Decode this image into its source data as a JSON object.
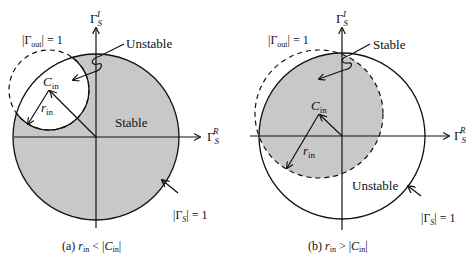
{
  "colors": {
    "shade": "#c8c8c8",
    "line": "#111111",
    "bg": "#ffffff"
  },
  "panel_a": {
    "axis_imag": "Γ",
    "axis_imag_sub": "S",
    "axis_imag_sup": "I",
    "axis_real": "Γ",
    "axis_real_sub": "S",
    "axis_real_sup": "R",
    "gamma_out_label_pre": "|Γ",
    "gamma_out_label_sub": "out",
    "gamma_out_label_post": "| = 1",
    "region_unstable": "Unstable",
    "region_stable": "Stable",
    "center_label": "C",
    "center_label_sub": "in",
    "radius_label": "r",
    "radius_label_sub": "in",
    "unit_circle_label_pre": "|Γ",
    "unit_circle_label_sub": "S",
    "unit_circle_label_post": "| = 1",
    "caption_pre": "(a) ",
    "caption_r": "r",
    "caption_r_sub": "in",
    "caption_mid": " < |",
    "caption_c": "C",
    "caption_c_sub": "in",
    "caption_post": "|"
  },
  "panel_b": {
    "axis_imag": "Γ",
    "axis_imag_sub": "S",
    "axis_imag_sup": "I",
    "axis_real": "Γ",
    "axis_real_sub": "S",
    "axis_real_sup": "R",
    "gamma_out_label_pre": "|Γ",
    "gamma_out_label_sub": "out",
    "gamma_out_label_post": "| = 1",
    "region_stable": "Stable",
    "region_unstable": "Unstable",
    "center_label": "C",
    "center_label_sub": "in",
    "radius_label": "r",
    "radius_label_sub": "in",
    "unit_circle_label_pre": "|Γ",
    "unit_circle_label_sub": "S",
    "unit_circle_label_post": "| = 1",
    "caption_pre": "(b) ",
    "caption_r": "r",
    "caption_r_sub": "in",
    "caption_mid": " > |",
    "caption_c": "C",
    "caption_c_sub": "in",
    "caption_post": "|"
  }
}
